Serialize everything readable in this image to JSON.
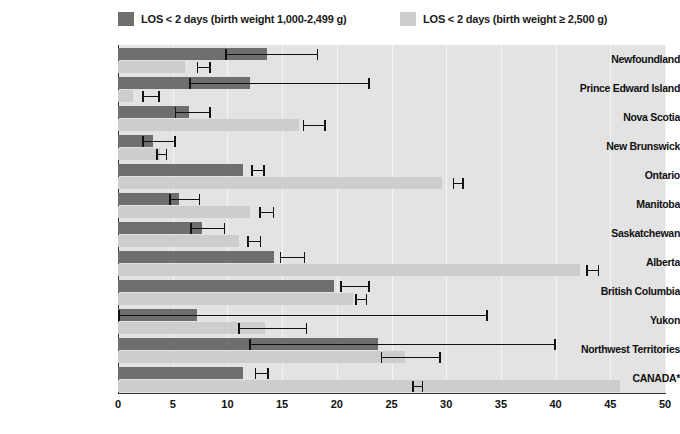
{
  "legend": {
    "items": [
      {
        "label": "LOS < 2 days (birth weight 1,000-2,499 g)",
        "color": "#6e6e6e",
        "x": 118
      },
      {
        "label": "LOS < 2 days (birth weight ≥ 2,500 g)",
        "color": "#cdcdcd",
        "x": 400
      }
    ]
  },
  "chart_data": {
    "type": "bar",
    "orientation": "horizontal",
    "title": "",
    "xlabel": "",
    "ylabel": "",
    "xlim": [
      0,
      50
    ],
    "xticks": [
      0,
      5,
      10,
      15,
      20,
      25,
      30,
      35,
      40,
      45,
      50
    ],
    "grid": true,
    "grid_axis": "x",
    "legend_position": "top",
    "categories": [
      "Newfoundland",
      "Prince Edward Island",
      "Nova Scotia",
      "New Brunswick",
      "Ontario",
      "Manitoba",
      "Saskatchewan",
      "Alberta",
      "British Columbia",
      "Yukon",
      "Northwest Territories",
      "CANADA*"
    ],
    "series": [
      {
        "name": "LOS < 2 days (birth weight 1,000-2,499 g)",
        "color": "#6e6e6e",
        "values": [
          13.6,
          12.1,
          6.5,
          3.2,
          11.4,
          5.6,
          7.7,
          14.3,
          19.7,
          7.2,
          23.8,
          11.4
        ],
        "errors": [
          [
            9.8,
            18.3
          ],
          [
            6.5,
            23.0
          ],
          [
            5.2,
            8.5
          ],
          [
            2.2,
            5.3
          ],
          [
            12.2,
            13.4
          ],
          [
            4.7,
            7.5
          ],
          [
            6.6,
            9.8
          ],
          [
            14.8,
            17.1
          ],
          [
            20.3,
            23.0
          ],
          [
            0.0,
            33.8
          ],
          [
            12.0,
            40.0
          ],
          [
            12.5,
            13.8
          ]
        ]
      },
      {
        "name": "LOS < 2 days (birth weight ≥ 2,500 g)",
        "color": "#cdcdcd",
        "values": [
          6.1,
          1.4,
          16.5,
          3.8,
          29.6,
          12.1,
          11.1,
          42.2,
          21.5,
          13.4,
          26.2,
          45.9
        ],
        "errors": [
          [
            7.2,
            8.5
          ],
          [
            2.2,
            3.8
          ],
          [
            16.9,
            19.0
          ],
          [
            3.5,
            4.5
          ],
          [
            30.6,
            31.6
          ],
          [
            12.9,
            14.3
          ],
          [
            11.8,
            13.1
          ],
          [
            42.8,
            44.0
          ],
          [
            21.7,
            22.8
          ],
          [
            11.0,
            17.3
          ],
          [
            24.0,
            29.5
          ],
          [
            26.9,
            27.9
          ]
        ]
      }
    ]
  }
}
